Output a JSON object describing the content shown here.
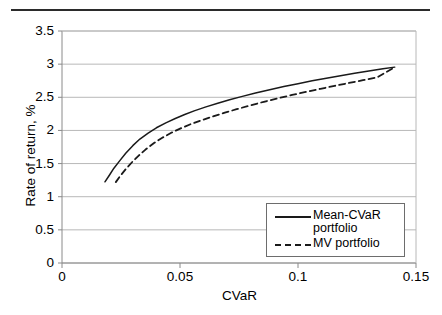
{
  "chart_data": {
    "type": "line",
    "title": "",
    "xlabel": "CVaR",
    "ylabel": "Rate of return, %",
    "xlim": [
      0,
      0.15
    ],
    "ylim": [
      0,
      3.5
    ],
    "xticks": [
      "0",
      "0.05",
      "0.1",
      "0.15"
    ],
    "xtick_values": [
      0,
      0.05,
      0.1,
      0.15
    ],
    "yticks": [
      "0",
      "0.5",
      "1",
      "1.5",
      "2",
      "2.5",
      "3",
      "3.5"
    ],
    "ytick_values": [
      0,
      0.5,
      1,
      1.5,
      2,
      2.5,
      3,
      3.5
    ],
    "grid": "horizontal",
    "legend_position": "inside-bottom-right",
    "series": [
      {
        "name": "Mean-CVaR portfolio",
        "style": "solid",
        "color": "#1a1a1a",
        "x": [
          0.0182,
          0.02,
          0.022,
          0.0245,
          0.027,
          0.03,
          0.033,
          0.0365,
          0.04,
          0.044,
          0.048,
          0.052,
          0.056,
          0.061,
          0.066,
          0.071,
          0.076,
          0.082,
          0.088,
          0.094,
          0.1,
          0.106,
          0.112,
          0.118,
          0.124,
          0.13,
          0.136,
          0.141
        ],
        "y": [
          1.225,
          1.32,
          1.43,
          1.545,
          1.655,
          1.77,
          1.87,
          1.96,
          2.04,
          2.115,
          2.18,
          2.24,
          2.295,
          2.355,
          2.41,
          2.462,
          2.51,
          2.565,
          2.615,
          2.662,
          2.705,
          2.748,
          2.788,
          2.825,
          2.862,
          2.898,
          2.932,
          2.955
        ]
      },
      {
        "name": "MV portfolio",
        "style": "dashed",
        "color": "#1a1a1a",
        "x": [
          0.0228,
          0.0248,
          0.027,
          0.0298,
          0.0325,
          0.0355,
          0.039,
          0.0425,
          0.0465,
          0.0505,
          0.0548,
          0.059,
          0.064,
          0.069,
          0.074,
          0.0795,
          0.0855,
          0.0915,
          0.0975,
          0.1035,
          0.1095,
          0.1155,
          0.1215,
          0.1275,
          0.1335,
          0.141
        ],
        "y": [
          1.22,
          1.32,
          1.415,
          1.525,
          1.62,
          1.715,
          1.81,
          1.89,
          1.968,
          2.035,
          2.098,
          2.152,
          2.212,
          2.268,
          2.32,
          2.375,
          2.432,
          2.485,
          2.535,
          2.582,
          2.628,
          2.672,
          2.715,
          2.758,
          2.8,
          2.955
        ]
      }
    ]
  },
  "legend": {
    "entries": [
      {
        "label": "Mean-CVaR portfolio",
        "style": "solid"
      },
      {
        "label": "MV portfolio",
        "style": "dashed"
      }
    ]
  },
  "colors": {
    "line": "#1a1a1a",
    "grid": "#b8b8b8",
    "axis": "#8a8a8a",
    "rule": "#2b2b2b",
    "background": "#ffffff"
  }
}
